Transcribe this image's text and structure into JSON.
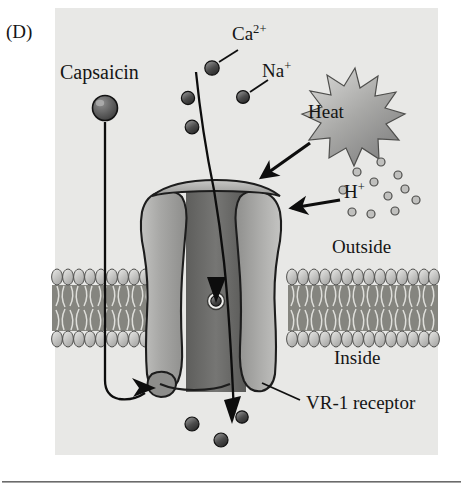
{
  "figure": {
    "panel_label": "(D)",
    "background_color": "#e8e8e6",
    "page_background": "#ffffff",
    "rule_color": "#6b6b6b"
  },
  "labels": {
    "capsaicin": "Capsaicin",
    "calcium": "Ca",
    "calcium_charge": "2+",
    "sodium": "Na",
    "sodium_charge": "+",
    "proton": "H",
    "proton_charge": "+",
    "heat": "Heat",
    "outside": "Outside",
    "inside": "Inside",
    "receptor": "VR-1 receptor"
  },
  "colors": {
    "ion_fill": "#4a4a4a",
    "ion_stroke": "#141414",
    "proton_fill": "#b8b8b6",
    "proton_stroke": "#4a4a4a",
    "channel_light": "#b4b4b2",
    "channel_dark": "#6e6e6c",
    "membrane_head": "#c9c9c6",
    "membrane_core": "#7d7d7a",
    "arrow": "#0d0d0d",
    "star_fill": "#9e9e9c"
  },
  "elements": {
    "capsaicin_molecule": "capsaicin-sphere",
    "heat_starburst": "heat-star",
    "channel": "vr1-channel-protein",
    "membrane": "lipid-bilayer",
    "pore_ion": "pore-ion",
    "ion_count_outside": 4,
    "ion_count_inside": 3,
    "proton_count": 11
  }
}
